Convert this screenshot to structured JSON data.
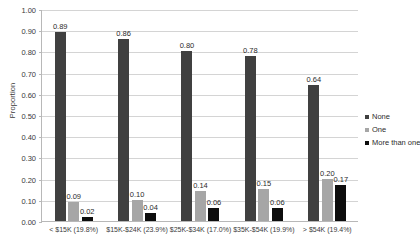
{
  "chart_data": {
    "type": "bar",
    "title": "",
    "xlabel": "",
    "ylabel": "Proportion",
    "ylim": [
      0,
      1.0
    ],
    "ytick_labels": [
      "1.00",
      "0.90",
      "0.80",
      "0.70",
      "0.60",
      "0.50",
      "0.40",
      "0.30",
      "0.20",
      "0.10",
      "0.00"
    ],
    "ytick_values": [
      1.0,
      0.9,
      0.8,
      0.7,
      0.6,
      0.5,
      0.4,
      0.3,
      0.2,
      0.1,
      0.0
    ],
    "grid": true,
    "legend_position": "right",
    "categories": [
      "< $15K (19.8%)",
      "$15K-$24K (23.9%)",
      "$25K-$34K (17.0%)",
      "$35K-$54K (19.9%)",
      "> $54K (19.4%)"
    ],
    "series": [
      {
        "name": "None",
        "color": "#404040",
        "values": [
          0.89,
          0.86,
          0.8,
          0.78,
          0.64
        ],
        "labels": [
          "0.89",
          "0.86",
          "0.80",
          "0.78",
          "0.64"
        ]
      },
      {
        "name": "One",
        "color": "#a6a6a6",
        "values": [
          0.09,
          0.1,
          0.14,
          0.15,
          0.2
        ],
        "labels": [
          "0.09",
          "0.10",
          "0.14",
          "0.15",
          "0.20"
        ]
      },
      {
        "name": "More than one",
        "color": "#0d0d0d",
        "values": [
          0.02,
          0.04,
          0.06,
          0.06,
          0.17
        ],
        "labels": [
          "0.02",
          "0.04",
          "0.06",
          "0.06",
          "0.17"
        ]
      }
    ]
  }
}
